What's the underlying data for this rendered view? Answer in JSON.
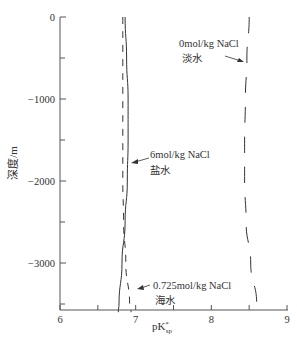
{
  "chart_data": {
    "type": "line",
    "title": "",
    "xlabel": "pK*sp",
    "xlabel_main": "pK",
    "xlabel_sup": "*",
    "xlabel_sub": "sp",
    "ylabel": "深度/m",
    "xlim": [
      6,
      9
    ],
    "ylim": [
      -3600,
      0
    ],
    "x_ticks": [
      6,
      7,
      8,
      9
    ],
    "x_tick_labels": [
      "6",
      "7",
      "8",
      "9"
    ],
    "x_minor_ticks": [
      6.5,
      7.5,
      8.5
    ],
    "y_ticks": [
      0,
      -1000,
      -2000,
      -3000
    ],
    "y_tick_labels": [
      "0",
      "-1000",
      "-2000",
      "-3000"
    ],
    "y_minor_ticks": [
      -500,
      -1500,
      -2500,
      -3500
    ],
    "grid": false,
    "legend": "inline annotations",
    "series": [
      {
        "name": "0mol/kg NaCl 淡水",
        "style": "dashed",
        "points": [
          {
            "pK": 8.5,
            "depth": 0
          },
          {
            "pK": 8.47,
            "depth": -500
          },
          {
            "pK": 8.45,
            "depth": -1000
          },
          {
            "pK": 8.44,
            "depth": -1500
          },
          {
            "pK": 8.44,
            "depth": -2000
          },
          {
            "pK": 8.46,
            "depth": -2500
          },
          {
            "pK": 8.52,
            "depth": -3000
          },
          {
            "pK": 8.6,
            "depth": -3500
          },
          {
            "pK": 8.62,
            "depth": -3600
          }
        ]
      },
      {
        "name": "6mol/kg NaCl 盐水",
        "style": "solid",
        "points": [
          {
            "pK": 6.86,
            "depth": 0
          },
          {
            "pK": 6.88,
            "depth": -500
          },
          {
            "pK": 6.9,
            "depth": -1000
          },
          {
            "pK": 6.9,
            "depth": -1500
          },
          {
            "pK": 6.89,
            "depth": -2000
          },
          {
            "pK": 6.86,
            "depth": -2500
          },
          {
            "pK": 6.82,
            "depth": -3000
          },
          {
            "pK": 6.78,
            "depth": -3500
          },
          {
            "pK": 6.77,
            "depth": -3600
          }
        ]
      },
      {
        "name": "0.725mol/kg NaCl 海水",
        "style": "dashed",
        "points": [
          {
            "pK": 6.83,
            "depth": 0
          },
          {
            "pK": 6.83,
            "depth": -500
          },
          {
            "pK": 6.83,
            "depth": -1000
          },
          {
            "pK": 6.83,
            "depth": -1500
          },
          {
            "pK": 6.83,
            "depth": -2000
          },
          {
            "pK": 6.84,
            "depth": -2500
          },
          {
            "pK": 6.87,
            "depth": -3000
          },
          {
            "pK": 6.92,
            "depth": -3500
          },
          {
            "pK": 6.94,
            "depth": -3600
          }
        ]
      }
    ],
    "annotations": [
      {
        "line1": "0mol/kg NaCl",
        "line2": "淡水",
        "target": "0mol/kg NaCl 淡水"
      },
      {
        "line1": "6mol/kg NaCl",
        "line2": "盐水",
        "target": "6mol/kg NaCl 盐水"
      },
      {
        "line1": "0.725mol/kg NaCl",
        "line2": "海水",
        "target": "0.725mol/kg NaCl 海水"
      }
    ]
  }
}
